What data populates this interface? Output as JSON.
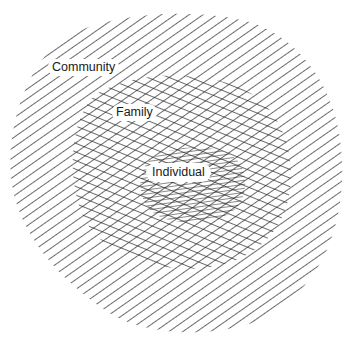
{
  "diagram": {
    "type": "nested-hatched-regions",
    "regions": [
      {
        "id": "outer",
        "label": "Community",
        "hatch": "single diagonal (rising)"
      },
      {
        "id": "middle",
        "label": "Family",
        "hatch": "cross-hatched"
      },
      {
        "id": "inner",
        "label": "Individual",
        "hatch": "dense triple hatching"
      }
    ],
    "colors": {
      "line": "#2a2a2a",
      "background": "#ffffff"
    }
  },
  "labels": {
    "community": "Community",
    "family": "Family",
    "individual": "Individual"
  }
}
